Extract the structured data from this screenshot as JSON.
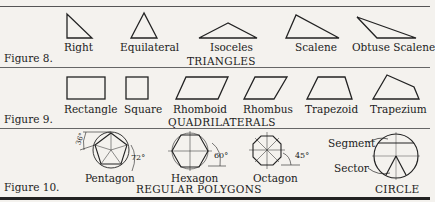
{
  "figures": [
    {
      "label": "Figure 8.",
      "section": "TRIANGLES",
      "shapes": [
        "Right",
        "Equilateral",
        "Isoceles",
        "Scalene",
        "Obtuse Scalene"
      ]
    },
    {
      "label": "Figure 9.",
      "section": "QUADRILATERALS",
      "shapes": [
        "Rectangle",
        "Square",
        "Rhomboid",
        "Rhombus",
        "Trapezoid",
        "Trapezium"
      ]
    },
    {
      "label": "Figure 10.",
      "section": "REGULAR POLYGONS",
      "section2": "CIRCLE",
      "shapes": [
        "Pentagon",
        "Hexagon",
        "Octagon"
      ],
      "angles": {
        "pentagon_outer": "36°",
        "pentagon": "72°",
        "hexagon": "60°",
        "octagon": "45°"
      },
      "circle_parts": [
        "Segment",
        "Sector"
      ]
    }
  ]
}
